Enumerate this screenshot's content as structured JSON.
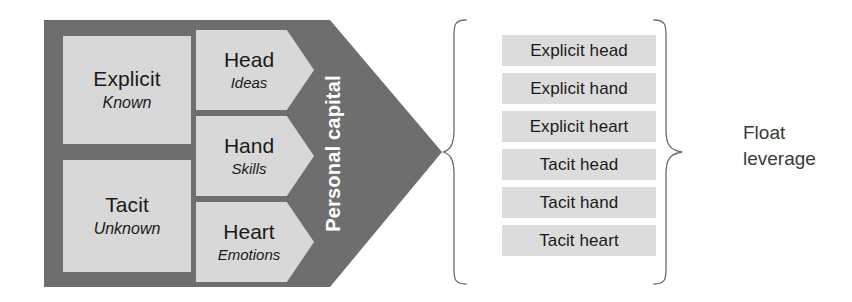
{
  "diagram": {
    "colors": {
      "dark_band": "#6e6e6e",
      "light_box": "#d8d8d8",
      "list_bar": "#dcdcdc",
      "text_dark": "#1a1a1a",
      "text_white": "#ffffff",
      "brace_stroke": "#6b6b6b",
      "background": "#ffffff"
    }
  },
  "left_block": {
    "band_label": "Personal capital",
    "knowledge_boxes": [
      {
        "title": "Explicit",
        "subtitle": "Known"
      },
      {
        "title": "Tacit",
        "subtitle": "Unknown"
      }
    ],
    "capability_chevrons": [
      {
        "title": "Head",
        "subtitle": "Ideas"
      },
      {
        "title": "Hand",
        "subtitle": "Skills"
      },
      {
        "title": "Heart",
        "subtitle": "Emotions"
      }
    ]
  },
  "combinations": {
    "items": [
      "Explicit head",
      "Explicit hand",
      "Explicit heart",
      "Tacit head",
      "Tacit hand",
      "Tacit heart"
    ]
  },
  "outcome": {
    "line1": "Float",
    "line2": "leverage"
  }
}
